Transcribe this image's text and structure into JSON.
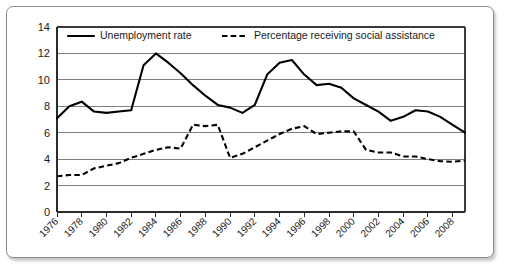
{
  "figure": {
    "frame_style": "rounded-white-panel-with-drop-shadow"
  },
  "chart_data": {
    "type": "line",
    "title": "",
    "subtitle": "",
    "xlabel": "",
    "ylabel": "",
    "xlim": [
      1976,
      2009
    ],
    "ylim": [
      0,
      14
    ],
    "ytick_step": 2,
    "yticks": [
      0,
      2,
      4,
      6,
      8,
      10,
      12,
      14
    ],
    "ytick_labels": [
      "0",
      "2",
      "4",
      "6",
      "8",
      "10",
      "12",
      "14"
    ],
    "xticks": [
      1976,
      1978,
      1980,
      1982,
      1984,
      1986,
      1988,
      1990,
      1992,
      1994,
      1996,
      1998,
      2000,
      2002,
      2004,
      2006,
      2008
    ],
    "xtick_labels": [
      "1976",
      "1978",
      "1980",
      "1982",
      "1984",
      "1986",
      "1988",
      "1990",
      "1992",
      "1994",
      "1996",
      "1998",
      "2000",
      "2002",
      "2004",
      "2006",
      "2008"
    ],
    "x": [
      1976,
      1977,
      1978,
      1979,
      1980,
      1981,
      1982,
      1983,
      1984,
      1985,
      1986,
      1987,
      1988,
      1989,
      1990,
      1991,
      1992,
      1993,
      1994,
      1995,
      1996,
      1997,
      1998,
      1999,
      2000,
      2001,
      2002,
      2003,
      2004,
      2005,
      2006,
      2007,
      2008,
      2009
    ],
    "grid": true,
    "grid_axis": "y",
    "legend_position": "top-inside",
    "series": [
      {
        "name": "Unemployment rate",
        "style": "solid",
        "color": "#000000",
        "values": [
          7.1,
          8.0,
          8.35,
          7.6,
          7.5,
          7.6,
          7.7,
          11.1,
          12.0,
          11.3,
          10.5,
          9.6,
          8.8,
          8.1,
          7.9,
          7.5,
          8.1,
          10.4,
          11.3,
          11.5,
          10.4,
          9.6,
          9.7,
          9.4,
          8.6,
          8.1,
          7.6,
          6.9,
          7.2,
          7.7,
          7.6,
          7.2,
          6.6,
          6.0
        ]
      },
      {
        "name": "Percentage receiving social assistance",
        "style": "dashed",
        "color": "#000000",
        "values": [
          2.7,
          2.8,
          2.8,
          3.3,
          3.5,
          3.7,
          4.1,
          4.4,
          4.7,
          4.9,
          4.8,
          6.6,
          6.5,
          6.6,
          4.1,
          4.4,
          4.9,
          5.4,
          5.9,
          6.3,
          6.5,
          5.9,
          6.0,
          6.1,
          6.1,
          4.7,
          4.5,
          4.5,
          4.2,
          4.2,
          4.0,
          3.85,
          3.8,
          3.9
        ]
      }
    ],
    "note": "Solid line = unemployment rate; dashed line = percentage receiving social assistance. Both in percent."
  },
  "legend": {
    "items": [
      {
        "label": "Unemployment rate",
        "marker": "solid-line-swatch"
      },
      {
        "label": "Percentage receiving social assistance",
        "marker": "dashed-line-swatch"
      }
    ]
  }
}
